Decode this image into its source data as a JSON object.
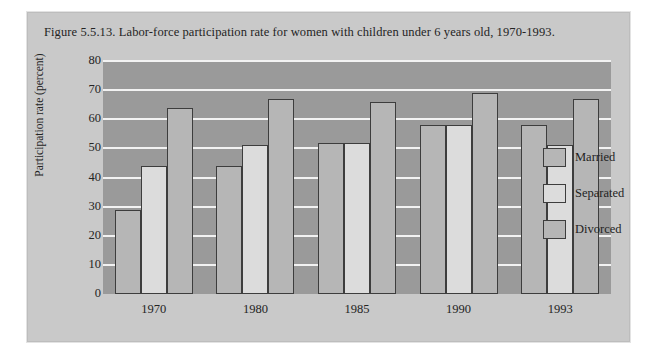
{
  "figure": {
    "caption": "Figure 5.5.13. Labor-force participation rate for women with children under 6 years old, 1970-1993."
  },
  "chart_data": {
    "type": "bar",
    "title": "Figure 5.5.13. Labor-force participation rate for women with children under 6 years old, 1970-1993.",
    "xlabel": "",
    "ylabel": "Participation rate (percent)",
    "ylim": [
      0,
      80
    ],
    "ytick_step": 10,
    "yticks": [
      0,
      10,
      20,
      30,
      40,
      50,
      60,
      70,
      80
    ],
    "categories": [
      "1970",
      "1980",
      "1985",
      "1990",
      "1993"
    ],
    "grid": "horizontal",
    "legend_position": "right-inside",
    "series": [
      {
        "name": "Married",
        "color": "#b6b6b6",
        "values": [
          29,
          44,
          52,
          58,
          58
        ]
      },
      {
        "name": "Separated",
        "color": "#dcdcdc",
        "values": [
          44,
          51,
          52,
          58,
          51
        ]
      },
      {
        "name": "Divorced",
        "color": "#b6b6b6",
        "values": [
          64,
          67,
          66,
          69,
          67
        ]
      }
    ],
    "plot_background": "#9a9a9a",
    "gridline_color": "#f2f2f2",
    "panel_background": "#c9c9c9"
  }
}
